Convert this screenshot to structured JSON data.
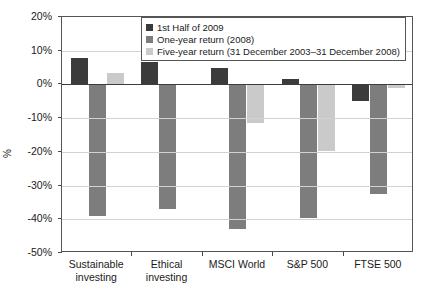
{
  "chart_data": {
    "type": "bar",
    "title": "",
    "xlabel": "",
    "ylabel": "%",
    "ylim": [
      -50,
      20
    ],
    "ytick_labels": [
      "20%",
      "10%",
      "0%",
      "-10%",
      "-20%",
      "-30%",
      "-40%",
      "-50%"
    ],
    "ytick_values": [
      20,
      10,
      0,
      -10,
      -20,
      -30,
      -40,
      -50
    ],
    "grid": true,
    "legend_position": "top-center",
    "categories": [
      "Sustainable investing",
      "Ethical investing",
      "MSCI World",
      "S&P 500",
      "FTSE 500"
    ],
    "category_lines": [
      [
        "Sustainable",
        "investing"
      ],
      [
        "Ethical",
        "investing"
      ],
      [
        "MSCI World",
        ""
      ],
      [
        "S&P 500",
        ""
      ],
      [
        "FTSE 500",
        ""
      ]
    ],
    "series": [
      {
        "name": "1st Half of 2009",
        "color": "#3b3b3b",
        "values": [
          7.7,
          6.7,
          4.8,
          1.7,
          -5.0
        ]
      },
      {
        "name": "One-year return (2008)",
        "color": "#7d7d7d",
        "values": [
          -39.0,
          -36.9,
          -42.8,
          -39.6,
          -32.4
        ]
      },
      {
        "name": "Five-year return (31 December 2003–31 December 2008)",
        "color": "#cacaca",
        "values": [
          3.3,
          0.0,
          -11.3,
          -19.7,
          -1.0
        ]
      }
    ]
  },
  "legend": {
    "items": [
      "1st Half of 2009",
      "One-year return (2008)",
      "Five-year return (31 December 2003–31 December 2008)"
    ]
  }
}
